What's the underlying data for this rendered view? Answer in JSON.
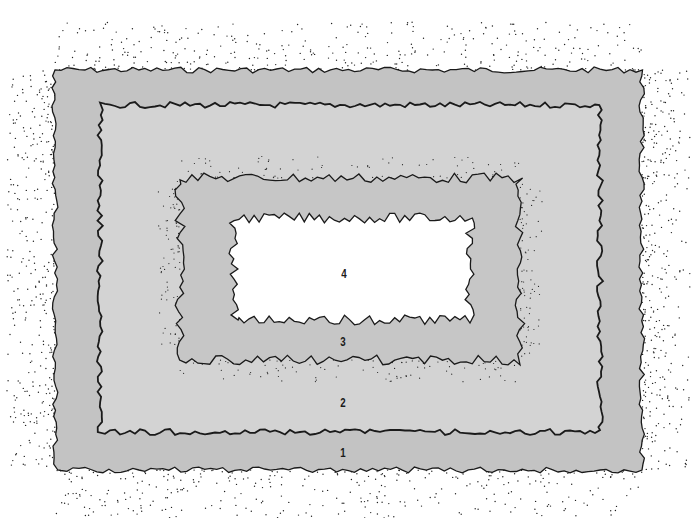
{
  "diagram": {
    "type": "nested concentric zones",
    "colors": {
      "background": "#ffffff",
      "zone1": "#c3c3c3",
      "zone2": "#d3d3d3",
      "zone3": "#c6c6c6",
      "zone4": "#ffffff",
      "outline": "#1a1a1a",
      "stipple": "#222222"
    },
    "zones": [
      {
        "id": "1",
        "label": "1",
        "bounds": [
          55,
          70,
          642,
          470
        ],
        "label_pos": [
          343,
          452
        ]
      },
      {
        "id": "2",
        "label": "2",
        "bounds": [
          100,
          105,
          600,
          432
        ],
        "label_pos": [
          343,
          402
        ]
      },
      {
        "id": "3",
        "label": "3",
        "bounds": [
          180,
          178,
          520,
          360
        ],
        "label_pos": [
          343,
          341
        ]
      },
      {
        "id": "4",
        "label": "4",
        "bounds": [
          234,
          218,
          470,
          320
        ],
        "label_pos": [
          344,
          273
        ]
      }
    ]
  }
}
